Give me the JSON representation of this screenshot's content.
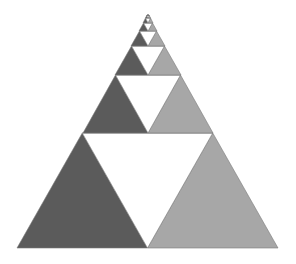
{
  "diagram": {
    "title": "",
    "type": "recursive-triangle-fractal",
    "colors": {
      "background": "#ffffff",
      "dark_fill": "#5b5b5b",
      "light_fill": "#a7a7a7",
      "hole_fill": "#ffffff",
      "outline": "#7a7a7a"
    },
    "levels": [
      {
        "level": 1,
        "left_x": 17,
        "right_x": 278,
        "base_y": 248,
        "top_y": 133
      },
      {
        "level": 2,
        "left_x": 83,
        "right_x": 213,
        "base_y": 133,
        "top_y": 75
      },
      {
        "level": 3,
        "left_x": 115,
        "right_x": 181,
        "base_y": 75,
        "top_y": 46
      },
      {
        "level": 4,
        "left_x": 131,
        "right_x": 165,
        "base_y": 46,
        "top_y": 31
      },
      {
        "level": 5,
        "left_x": 139,
        "right_x": 157,
        "base_y": 31,
        "top_y": 23
      },
      {
        "level": 6,
        "left_x": 143,
        "right_x": 153,
        "base_y": 23,
        "top_y": 18
      },
      {
        "level": 7,
        "left_x": 145.5,
        "right_x": 150.5,
        "base_y": 18,
        "top_y": 15.5
      }
    ],
    "apex": {
      "x": 148,
      "y": 14
    }
  }
}
